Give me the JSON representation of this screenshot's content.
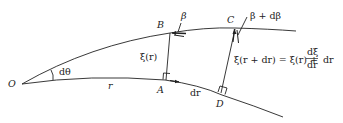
{
  "diagram": {
    "points": {
      "O": "O",
      "A": "A",
      "B": "B",
      "C": "C",
      "D": "D"
    },
    "labels": {
      "angle": "dθ",
      "radius": "r",
      "dr": "dr",
      "xi_r": "ξ(r)",
      "beta": "β",
      "beta_plus": "β + dβ",
      "xi_rdr_lhs": "ξ(r + dr) = ξ(r) + ",
      "frac_num": "dξ",
      "frac_den": "dr",
      "xi_rdr_tail": "dr"
    },
    "colors": {
      "ink": "#222222",
      "background": "#ffffff"
    }
  }
}
